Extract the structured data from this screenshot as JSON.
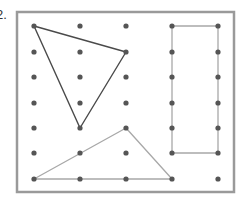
{
  "question": {
    "number": "2."
  },
  "geoboard": {
    "frame": {
      "x": 17,
      "y": 12,
      "width": 217,
      "height": 180,
      "stroke": "#9a9a9a",
      "stroke_width": 2.5
    },
    "grid": {
      "cols_x": [
        34,
        80,
        126,
        172,
        218
      ],
      "rows_y": [
        26,
        52,
        77,
        103,
        128,
        153,
        179
      ],
      "dot_color": "#555555",
      "dot_radius": 2.6
    },
    "shapes": [
      {
        "name": "dark-triangle",
        "points": [
          [
            0,
            0
          ],
          [
            2,
            1
          ],
          [
            1,
            4
          ]
        ],
        "stroke": "#4a4a4a",
        "stroke_width": 1.4
      },
      {
        "name": "light-triangle",
        "points": [
          [
            0,
            6
          ],
          [
            2,
            4
          ],
          [
            3,
            6
          ]
        ],
        "stroke": "#a8a8a8",
        "stroke_width": 1.3
      },
      {
        "name": "rectangle",
        "points": [
          [
            3,
            0
          ],
          [
            4,
            0
          ],
          [
            4,
            5
          ],
          [
            3,
            5
          ]
        ],
        "stroke": "#a8a8a8",
        "stroke_width": 1.3
      }
    ]
  }
}
